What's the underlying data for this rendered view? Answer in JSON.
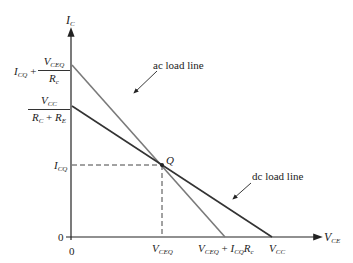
{
  "diagram": {
    "title": "",
    "axes": {
      "y_label_main": "I",
      "y_label_sub": "C",
      "x_label_main": "V",
      "x_label_sub": "CE",
      "origin_x_label": "0",
      "origin_y_label": "0"
    },
    "y_ticks": {
      "ac_intercept": {
        "prefix_main": "I",
        "prefix_sub": "CQ",
        "plus": " + ",
        "num_main": "V",
        "num_sub": "CEQ",
        "den_main": "R",
        "den_sub": "c"
      },
      "dc_intercept": {
        "num_main": "V",
        "num_sub": "CC",
        "den_a_main": "R",
        "den_a_sub": "C",
        "den_plus": " + ",
        "den_b_main": "R",
        "den_b_sub": "E"
      },
      "icq": {
        "main": "I",
        "sub": "CQ"
      }
    },
    "x_ticks": {
      "vceq": {
        "main": "V",
        "sub": "CEQ"
      },
      "ac_intercept": {
        "a_main": "V",
        "a_sub": "CEQ",
        "plus": " + ",
        "b_main": "I",
        "b_sub": "CQ",
        "c_main": "R",
        "c_sub": "c"
      },
      "vcc": {
        "main": "V",
        "sub": "CC"
      }
    },
    "q_point_label": "Q",
    "annotations": {
      "ac_load_line": "ac load line",
      "dc_load_line": "dc load line"
    },
    "colors": {
      "axis": "#222222",
      "ac_line": "#7a7a7a",
      "dc_line": "#333333",
      "dashed": "#444444"
    }
  }
}
